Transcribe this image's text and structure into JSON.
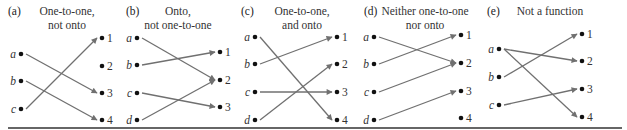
{
  "figure": {
    "panels": [
      {
        "id": "a",
        "label": "(a)",
        "title_lines": [
          "One-to-one,",
          "not onto"
        ],
        "label_x": 8,
        "title_x": 67,
        "domain_x": 21,
        "codomain_x": 102,
        "domain": [
          {
            "name": "a",
            "y": 54
          },
          {
            "name": "b",
            "y": 81
          },
          {
            "name": "c",
            "y": 109
          }
        ],
        "codomain": [
          {
            "name": "1",
            "y": 38
          },
          {
            "name": "2",
            "y": 66
          },
          {
            "name": "3",
            "y": 93
          },
          {
            "name": "4",
            "y": 120
          }
        ],
        "mappings": [
          [
            "a",
            "3"
          ],
          [
            "b",
            "4"
          ],
          [
            "c",
            "1"
          ]
        ]
      },
      {
        "id": "b",
        "label": "(b)",
        "title_lines": [
          "Onto,",
          "not one-to-one"
        ],
        "label_x": 126,
        "title_x": 178,
        "domain_x": 137,
        "codomain_x": 220,
        "domain": [
          {
            "name": "a",
            "y": 38
          },
          {
            "name": "b",
            "y": 65
          },
          {
            "name": "c",
            "y": 93
          },
          {
            "name": "d",
            "y": 120
          }
        ],
        "codomain": [
          {
            "name": "1",
            "y": 52
          },
          {
            "name": "2",
            "y": 80
          },
          {
            "name": "3",
            "y": 107
          }
        ],
        "mappings": [
          [
            "a",
            "2"
          ],
          [
            "b",
            "1"
          ],
          [
            "c",
            "3"
          ],
          [
            "d",
            "2"
          ]
        ]
      },
      {
        "id": "c",
        "label": "(c)",
        "title_lines": [
          "One-to-one,",
          "and onto"
        ],
        "label_x": 241,
        "title_x": 302,
        "domain_x": 255,
        "codomain_x": 337,
        "domain": [
          {
            "name": "a",
            "y": 37
          },
          {
            "name": "b",
            "y": 64
          },
          {
            "name": "c",
            "y": 92
          },
          {
            "name": "d",
            "y": 120
          }
        ],
        "codomain": [
          {
            "name": "1",
            "y": 37
          },
          {
            "name": "2",
            "y": 64
          },
          {
            "name": "3",
            "y": 92
          },
          {
            "name": "4",
            "y": 120
          }
        ],
        "mappings": [
          [
            "a",
            "4"
          ],
          [
            "b",
            "1"
          ],
          [
            "c",
            "3"
          ],
          [
            "d",
            "2"
          ]
        ]
      },
      {
        "id": "d",
        "label": "(d)",
        "title_lines": [
          "Neither one-to-one",
          "nor onto"
        ],
        "label_x": 364,
        "title_x": 425,
        "domain_x": 374,
        "codomain_x": 461,
        "domain": [
          {
            "name": "a",
            "y": 37
          },
          {
            "name": "b",
            "y": 64
          },
          {
            "name": "c",
            "y": 92
          },
          {
            "name": "d",
            "y": 120
          }
        ],
        "codomain": [
          {
            "name": "1",
            "y": 35
          },
          {
            "name": "2",
            "y": 63
          },
          {
            "name": "3",
            "y": 91
          },
          {
            "name": "4",
            "y": 118
          }
        ],
        "mappings": [
          [
            "a",
            "2"
          ],
          [
            "b",
            "1"
          ],
          [
            "c",
            "2"
          ],
          [
            "d",
            "3"
          ]
        ]
      },
      {
        "id": "e",
        "label": "(e)",
        "title_lines": [
          "Not a function"
        ],
        "label_x": 487,
        "title_x": 550,
        "domain_x": 499,
        "codomain_x": 582,
        "domain": [
          {
            "name": "a",
            "y": 49
          },
          {
            "name": "b",
            "y": 77
          },
          {
            "name": "c",
            "y": 105
          }
        ],
        "codomain": [
          {
            "name": "1",
            "y": 34
          },
          {
            "name": "2",
            "y": 61
          },
          {
            "name": "3",
            "y": 89
          },
          {
            "name": "4",
            "y": 117
          }
        ],
        "mappings": [
          [
            "a",
            "2"
          ],
          [
            "a",
            "4"
          ],
          [
            "b",
            "1"
          ],
          [
            "c",
            "3"
          ]
        ]
      }
    ],
    "colors": {
      "arrow": "#707070",
      "dot": "#111111",
      "text": "#333333",
      "rule": "#333333"
    }
  }
}
